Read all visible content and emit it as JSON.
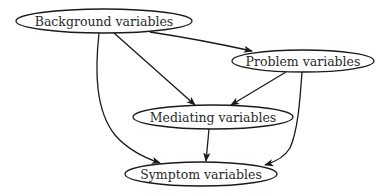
{
  "diagram": {
    "type": "directed-graph",
    "nodes": [
      {
        "id": "background",
        "label": "Background variables",
        "cx": 104,
        "cy": 21,
        "rx": 88,
        "ry": 12
      },
      {
        "id": "problem",
        "label": "Problem variables",
        "cx": 303,
        "cy": 61,
        "rx": 71,
        "ry": 11
      },
      {
        "id": "mediating",
        "label": "Mediating variables",
        "cx": 213,
        "cy": 117,
        "rx": 80,
        "ry": 12
      },
      {
        "id": "symptom",
        "label": "Symptom variables",
        "cx": 201,
        "cy": 174,
        "rx": 76,
        "ry": 12
      }
    ],
    "edges": [
      {
        "from": "background",
        "to": "problem"
      },
      {
        "from": "background",
        "to": "mediating"
      },
      {
        "from": "background",
        "to": "symptom"
      },
      {
        "from": "problem",
        "to": "mediating"
      },
      {
        "from": "problem",
        "to": "symptom"
      },
      {
        "from": "mediating",
        "to": "symptom"
      }
    ]
  }
}
